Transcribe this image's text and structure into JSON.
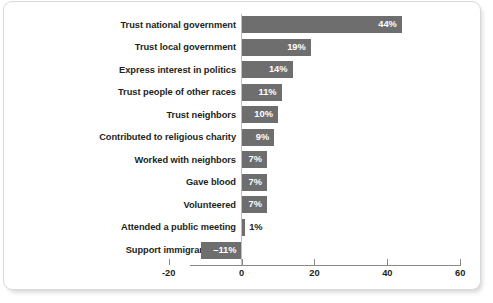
{
  "chart_data": {
    "type": "bar",
    "orientation": "horizontal",
    "title": "",
    "subtitle": "",
    "xlabel": "",
    "ylabel": "",
    "xlim": [
      -20,
      60
    ],
    "xticks": [
      -20,
      0,
      20,
      40,
      60
    ],
    "xtick_labels": [
      "-20",
      "0",
      "20",
      "40",
      "60"
    ],
    "grid": false,
    "legend": "none",
    "bar_color": "#6e6e6e",
    "label_color_inside": "#ffffff",
    "label_color_outside": "#231f20",
    "axis_color": "#8a8a8a",
    "categories": [
      "Trust national government",
      "Trust local government",
      "Express interest in politics",
      "Trust people of other races",
      "Trust neighbors",
      "Contributed to religious charity",
      "Worked with neighbors",
      "Gave blood",
      "Volunteered",
      "Attended a public meeting",
      "Support immigrant rights"
    ],
    "values": [
      44,
      19,
      14,
      11,
      10,
      9,
      7,
      7,
      7,
      1,
      -11
    ],
    "data_labels": [
      "44%",
      "19%",
      "14%",
      "11%",
      "10%",
      "9%",
      "7%",
      "7%",
      "7%",
      "1%",
      "–11%"
    ]
  }
}
